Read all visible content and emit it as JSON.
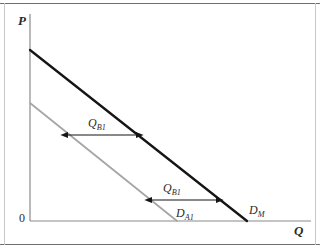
{
  "figure": {
    "type": "economics-demand-curve-diagram",
    "background_color": "#ffffff",
    "frame_color": "#6f6f6f"
  },
  "axes": {
    "y_label": "P",
    "x_label": "Q",
    "origin_label": "0",
    "axis_color": "#8a8a8a",
    "y_axis": {
      "x": 30,
      "y_top": 14,
      "y_bottom": 221
    },
    "x_axis": {
      "y": 221,
      "x_left": 30,
      "x_right": 311
    }
  },
  "curves": [
    {
      "name": "market-demand",
      "label": "D",
      "label_sub": "M",
      "color": "#151515",
      "width": 2.3,
      "intercept_y": {
        "x": 30,
        "y": 50
      },
      "intercept_x": {
        "x": 247,
        "y": 221
      }
    },
    {
      "name": "firm-a-demand",
      "label": "D",
      "label_sub": "A1",
      "color": "#a6a6a6",
      "width": 1.8,
      "intercept_y": {
        "x": 30,
        "y": 103
      },
      "intercept_x": {
        "x": 177,
        "y": 221
      }
    }
  ],
  "annotations": [
    {
      "name": "quantity-gap-upper",
      "label": "Q",
      "label_sub": "B1",
      "arrow": {
        "x1": 68,
        "x2": 136,
        "y": 135
      },
      "color": "#151515"
    },
    {
      "name": "quantity-gap-lower",
      "label": "Q",
      "label_sub": "B1",
      "arrow": {
        "x1": 152,
        "x2": 216,
        "y": 200
      },
      "color": "#151515"
    }
  ]
}
